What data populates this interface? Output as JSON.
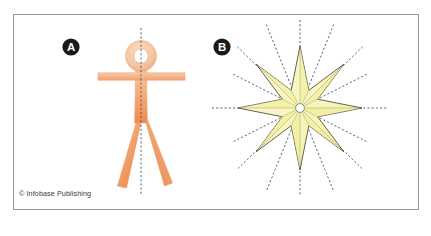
{
  "figure": {
    "panels": [
      {
        "id": "panel-a",
        "label": "A",
        "subject": "bilateral-symmetry-human-figure",
        "symmetry_type": "bilateral",
        "symmetry_line_count": 1
      },
      {
        "id": "panel-b",
        "label": "B",
        "subject": "radial-symmetry-eight-pointed-star",
        "symmetry_type": "radial",
        "symmetry_line_count": 16,
        "star_points": 8
      }
    ],
    "credit": "© Infobase Publishing"
  },
  "colors": {
    "frame_border": "#9a9a9a",
    "page_background": "#ffffff",
    "figure_light_orange": "#f8c9a4",
    "figure_mid_orange": "#f2a878",
    "figure_deep_orange": "#ef8b50",
    "figure_outline": "#eb9a68",
    "star_fill": "#f7f4ac",
    "star_fill_light": "#fbf9cf",
    "star_outline": "#2f2f24",
    "symmetry_line": "#3b4a63",
    "label_badge_fill": "#1a1a1a",
    "label_badge_text": "#ffffff",
    "credit_text": "#3a3a3a"
  },
  "geometry": {
    "panel_a": {
      "axis_x": 141,
      "axis_top": 28,
      "axis_bottom": 196,
      "head_center_y": 56,
      "head_outer_r": 15.5,
      "head_inner_r": 7.5,
      "arm_y": 76,
      "arm_left_x": 98,
      "arm_right_x": 185,
      "hip_y": 124,
      "foot_y": 186
    },
    "panel_b": {
      "center_x": 300,
      "center_y": 108,
      "outer_radius": 62,
      "inner_radius": 25,
      "hub_radius": 4.5,
      "ray_length": 88
    }
  }
}
